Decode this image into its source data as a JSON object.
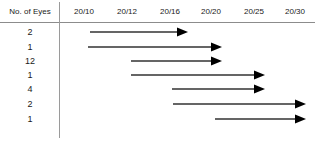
{
  "figure": {
    "row_header_label": "No. of Eyes",
    "divider_color": "#9a9a9a",
    "rule_color": "#8c8c8c",
    "arrow_color": "#000000"
  },
  "axis": {
    "ticks": [
      {
        "label": "20/10",
        "x": 84
      },
      {
        "label": "20/12",
        "x": 127
      },
      {
        "label": "20/16",
        "x": 170
      },
      {
        "label": "20/20",
        "x": 211
      },
      {
        "label": "20/25",
        "x": 254
      },
      {
        "label": "20/30",
        "x": 295
      }
    ]
  },
  "chart_data": {
    "type": "bar",
    "xlabel": "Visual acuity (Snellen)",
    "ylabel": "No. of Eyes",
    "categories": [
      "2",
      "1",
      "12",
      "1",
      "4",
      "2",
      "1"
    ],
    "tick_labels": [
      "20/10",
      "20/12",
      "20/16",
      "20/20",
      "20/25",
      "20/30"
    ],
    "grid": false,
    "legend": "none",
    "orientation": "horizontal-arrows",
    "series": [
      {
        "name": "acuity range",
        "values": [
          {
            "count": "2",
            "start_label": "20/10",
            "end_label": "20/18",
            "start_x": 90,
            "end_x": 188,
            "y": 32
          },
          {
            "count": "1",
            "start_label": "20/10",
            "end_label": "20/22",
            "start_x": 88,
            "end_x": 222,
            "y": 47
          },
          {
            "count": "12",
            "start_label": "20/13",
            "end_label": "20/22",
            "start_x": 131,
            "end_x": 222,
            "y": 61
          },
          {
            "count": "1",
            "start_label": "20/13",
            "end_label": "20/26",
            "start_x": 131,
            "end_x": 265,
            "y": 75
          },
          {
            "count": "4",
            "start_label": "20/17",
            "end_label": "20/26",
            "start_x": 172,
            "end_x": 265,
            "y": 89
          },
          {
            "count": "2",
            "start_label": "20/17",
            "end_label": "20/31",
            "start_x": 173,
            "end_x": 306,
            "y": 104
          },
          {
            "count": "1",
            "start_label": "20/21",
            "end_label": "20/31",
            "start_x": 215,
            "end_x": 306,
            "y": 119
          }
        ]
      }
    ]
  }
}
